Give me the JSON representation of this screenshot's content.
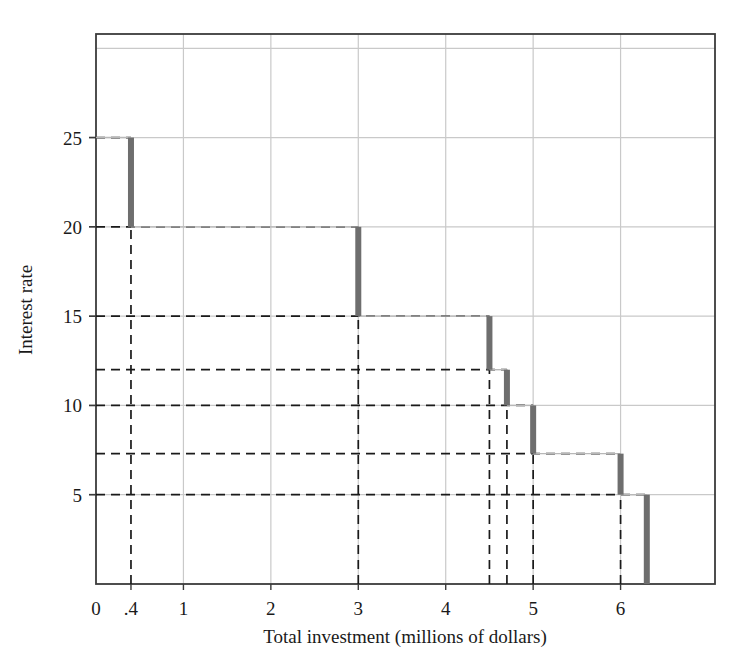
{
  "chart_data": {
    "type": "line",
    "title": "",
    "xlabel": "Total investment (millions of dollars)",
    "ylabel": "Interest rate",
    "xlim": [
      0,
      7.08
    ],
    "ylim": [
      0,
      30.8
    ],
    "grid": true,
    "legend": "none",
    "x_tick_labels": [
      "0",
      ".4",
      "1",
      "2",
      "3",
      "4",
      "5",
      "6"
    ],
    "x_tick_values": [
      0,
      0.4,
      1,
      2,
      3,
      4,
      5,
      6
    ],
    "y_tick_labels": [
      "5",
      "10",
      "15",
      "20",
      "25"
    ],
    "y_tick_values": [
      5,
      10,
      15,
      20,
      25
    ],
    "y_dashed_levels": [
      25,
      20,
      15,
      12,
      10,
      7.3,
      5
    ],
    "x_dashed_levels": [
      0.4,
      3,
      4.5,
      4.7,
      5,
      6,
      6.3
    ],
    "x_gridlines": [
      1,
      2,
      3,
      4,
      5,
      6
    ],
    "y_gridlines": [
      5,
      10,
      15,
      20,
      25,
      30
    ],
    "series_name": "Investment demand schedule",
    "steps": [
      {
        "x_start": 0,
        "x_end": 0.4,
        "rate": 25
      },
      {
        "x_start": 0.4,
        "x_end": 3,
        "rate": 20
      },
      {
        "x_start": 3,
        "x_end": 4.5,
        "rate": 15
      },
      {
        "x_start": 4.5,
        "x_end": 4.7,
        "rate": 12
      },
      {
        "x_start": 4.7,
        "x_end": 5,
        "rate": 10
      },
      {
        "x_start": 5,
        "x_end": 6,
        "rate": 7.3
      },
      {
        "x_start": 6,
        "x_end": 6.3,
        "rate": 5
      }
    ],
    "drop_bars": [
      {
        "x": 0.4,
        "y_top": 25,
        "y_bottom": 20
      },
      {
        "x": 3,
        "y_top": 20,
        "y_bottom": 15
      },
      {
        "x": 4.5,
        "y_top": 15,
        "y_bottom": 12
      },
      {
        "x": 4.7,
        "y_top": 12,
        "y_bottom": 10
      },
      {
        "x": 5,
        "y_top": 10,
        "y_bottom": 7.3
      },
      {
        "x": 6,
        "y_top": 7.3,
        "y_bottom": 5
      },
      {
        "x": 6.3,
        "y_top": 5,
        "y_bottom": 0
      }
    ],
    "colors": {
      "bar": "#6e6e6e",
      "grid": "#c9c9c9",
      "axis": "#3b3b3b",
      "dashed": "#1a1a1a",
      "background": "#ffffff"
    }
  },
  "axes": {
    "x_title": "Total investment (millions of dollars)",
    "y_title": "Interest rate",
    "x_ticks": [
      {
        "label": "0",
        "value": 0
      },
      {
        "label": ".4",
        "value": 0.4
      },
      {
        "label": "1",
        "value": 1
      },
      {
        "label": "2",
        "value": 2
      },
      {
        "label": "3",
        "value": 3
      },
      {
        "label": "4",
        "value": 4
      },
      {
        "label": "5",
        "value": 5
      },
      {
        "label": "6",
        "value": 6
      }
    ],
    "y_ticks": [
      {
        "label": "5",
        "value": 5
      },
      {
        "label": "10",
        "value": 10
      },
      {
        "label": "15",
        "value": 15
      },
      {
        "label": "20",
        "value": 20
      },
      {
        "label": "25",
        "value": 25
      }
    ]
  },
  "page": {
    "corner_mark": ""
  }
}
